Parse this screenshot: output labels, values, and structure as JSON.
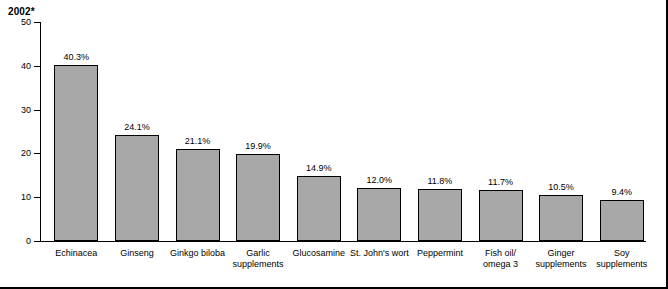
{
  "chart_data": {
    "type": "bar",
    "title": "2002*",
    "xlabel": "",
    "ylabel": "",
    "ylim": [
      0,
      50
    ],
    "yticks": [
      0,
      10,
      20,
      30,
      40,
      50
    ],
    "grid": false,
    "legend": null,
    "categories": [
      "Echinacea",
      "Ginseng",
      "Ginkgo biloba",
      "Garlic supplements",
      "Glucosamine",
      "St. John's wort",
      "Peppermint",
      "Fish oil/ omega 3",
      "Ginger supplements",
      "Soy supplements"
    ],
    "category_lines": [
      [
        "Echinacea"
      ],
      [
        "Ginseng"
      ],
      [
        "Ginkgo biloba"
      ],
      [
        "Garlic",
        "supplements"
      ],
      [
        "Glucosamine"
      ],
      [
        "St. John's wort"
      ],
      [
        "Peppermint"
      ],
      [
        "Fish oil/",
        "omega 3"
      ],
      [
        "Ginger",
        "supplements"
      ],
      [
        "Soy",
        "supplements"
      ]
    ],
    "values": [
      40.3,
      24.1,
      21.1,
      19.9,
      14.9,
      12.0,
      11.8,
      11.7,
      10.5,
      9.4
    ],
    "value_labels": [
      "40.3%",
      "24.1%",
      "21.1%",
      "19.9%",
      "14.9%",
      "12.0%",
      "11.8%",
      "11.7%",
      "10.5%",
      "9.4%"
    ],
    "bar_color": "#a8a8a8",
    "bar_border_color": "#000000",
    "axis_color": "#000000",
    "background_color": "#ffffff"
  }
}
